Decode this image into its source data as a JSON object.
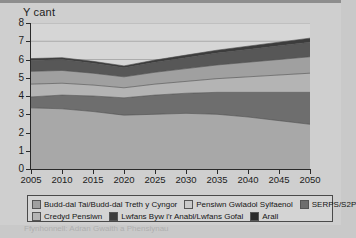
{
  "chart_data": {
    "type": "area",
    "stacked": true,
    "title": "Y cant",
    "xlabel": "",
    "ylabel": "Y cant",
    "xlim": [
      2005,
      2050
    ],
    "ylim": [
      0,
      8
    ],
    "grid": true,
    "legend_position": "bottom",
    "x": [
      2005,
      2010,
      2015,
      2020,
      2025,
      2030,
      2035,
      2040,
      2045,
      2050
    ],
    "x_ticks": [
      "2005",
      "2010",
      "2015",
      "2020",
      "2025",
      "2030",
      "2035",
      "2040",
      "2045",
      "2050"
    ],
    "y_ticks": [
      "0",
      "1",
      "2",
      "3",
      "4",
      "5",
      "6",
      "7",
      "8"
    ],
    "series": [
      {
        "name": "Pensiwn Gwladol Sylfaenol",
        "color": "#a8a8a8",
        "values": [
          3.35,
          3.3,
          3.15,
          2.95,
          3.0,
          3.05,
          3.0,
          2.85,
          2.65,
          2.45
        ]
      },
      {
        "name": "SERPS/S2P",
        "color": "#6e6e6e",
        "values": [
          0.6,
          0.75,
          0.85,
          0.95,
          1.05,
          1.1,
          1.2,
          1.35,
          1.55,
          1.75
        ]
      },
      {
        "name": "Credyd Pensiwn",
        "color": "#b4b4b4",
        "values": [
          0.7,
          0.65,
          0.6,
          0.55,
          0.6,
          0.65,
          0.75,
          0.85,
          0.95,
          1.05
        ]
      },
      {
        "name": "Budd-dal Tai/Budd-dal Treth y Cyngor",
        "color": "#a0a0a0",
        "values": [
          0.7,
          0.7,
          0.65,
          0.6,
          0.65,
          0.7,
          0.75,
          0.8,
          0.85,
          0.9
        ]
      },
      {
        "name": "Lwfans Byw i'r Anabl/Lwfans Gofal",
        "color": "#575757",
        "values": [
          0.6,
          0.6,
          0.55,
          0.5,
          0.55,
          0.6,
          0.65,
          0.7,
          0.75,
          0.8
        ]
      },
      {
        "name": "Arall",
        "color": "#3c3c3c",
        "values": [
          0.1,
          0.1,
          0.1,
          0.1,
          0.12,
          0.14,
          0.16,
          0.18,
          0.2,
          0.22
        ]
      }
    ],
    "totals": [
      6.05,
      6.1,
      5.9,
      5.65,
      5.97,
      6.24,
      6.51,
      6.73,
      6.95,
      7.17
    ]
  },
  "legend": {
    "items": [
      {
        "label": "Budd-dal Tai/Budd-dal Treth y Cyngor",
        "color": "#a0a0a0"
      },
      {
        "label": "Pensiwn Gwladol Sylfaenol",
        "color": "#cacaca"
      },
      {
        "label": "SERPS/S2P",
        "color": "#6e6e6e"
      },
      {
        "label": "Credyd Pensiwn",
        "color": "#b4b4b4"
      },
      {
        "label": "Lwfans Byw i'r Anabl/Lwfans Gofal",
        "color": "#3c3c3c"
      },
      {
        "label": "Arall",
        "color": "#2b2b2b"
      }
    ]
  },
  "caption": {
    "cut_off_text": "Ffynhonnell: Adran Gwaith a Phensiynau"
  }
}
